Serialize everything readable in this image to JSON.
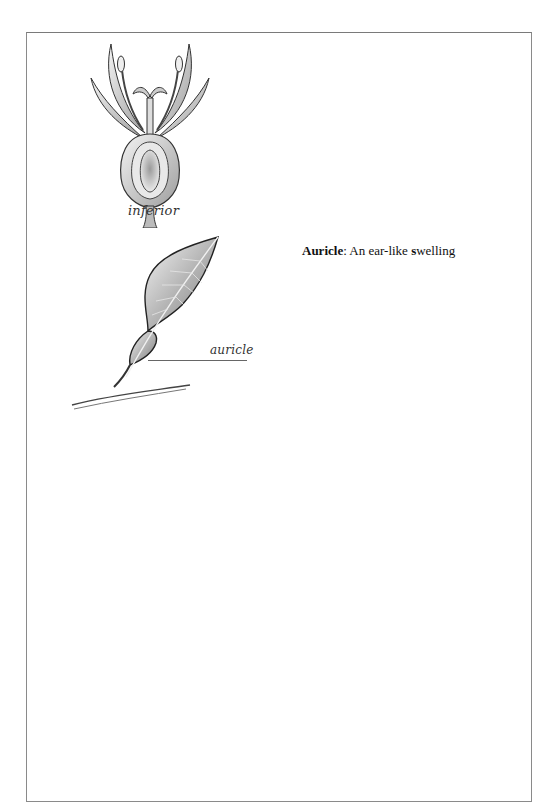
{
  "document": {
    "figures": [
      {
        "id": "flower",
        "label": "inferior",
        "illustration": "flower-with-inferior-ovary"
      },
      {
        "id": "leaf",
        "label": "auricle",
        "illustration": "leaf-with-auricle"
      }
    ],
    "entry": {
      "term": "Auricle",
      "separator": ":",
      "definition_prefix": " An ear-like ",
      "definition_emphasis": "s",
      "definition_suffix": "welling"
    }
  },
  "colors": {
    "frame_border": "#8a8a8a",
    "text": "#111111",
    "illustration_stroke": "#2b2b2b"
  }
}
